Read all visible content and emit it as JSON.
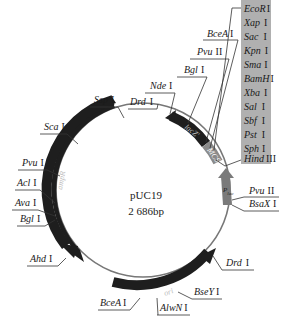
{
  "plasmid": {
    "name": "pUC19",
    "size": "2 686bp"
  },
  "features": [
    {
      "name": "lacZ'",
      "label": "lacZ'",
      "type": "gene",
      "color": "#1e1e1e"
    },
    {
      "name": "MCS",
      "label": "MCS",
      "type": "region",
      "color": "#8a8a8a"
    },
    {
      "name": "P_lac",
      "label": "P",
      "sub": "lac",
      "type": "promoter",
      "color": "#7a7a7a"
    },
    {
      "name": "ori",
      "label": "ori",
      "type": "origin",
      "color": "#1e1e1e"
    },
    {
      "name": "ampR",
      "label": "ampR",
      "type": "gene",
      "color": "#1e1e1e"
    }
  ],
  "mcs_box": {
    "background": "#b0b0b0",
    "sites": [
      {
        "name": "EcoR",
        "num": "I"
      },
      {
        "name": "Xap",
        "num": "I"
      },
      {
        "name": "Sac",
        "num": "I"
      },
      {
        "name": "Kpn",
        "num": "I"
      },
      {
        "name": "Sma",
        "num": "I"
      },
      {
        "name": "BamH",
        "num": "I"
      },
      {
        "name": "Xba",
        "num": "I"
      },
      {
        "name": "Sal",
        "num": "I"
      },
      {
        "name": "Sbf",
        "num": "I"
      },
      {
        "name": "Pst",
        "num": "I"
      },
      {
        "name": "Sph",
        "num": "I"
      },
      {
        "name": "Hind",
        "num": "III"
      }
    ]
  },
  "sites": {
    "bcea_top": {
      "name": "BceA",
      "num": "I"
    },
    "pvu2_top": {
      "name": "Pvu",
      "num": "II"
    },
    "bgl_top": {
      "name": "Bgl",
      "num": "I"
    },
    "nde": {
      "name": "Nde",
      "num": "I"
    },
    "drd_top": {
      "name": "Drd",
      "num": "I"
    },
    "ssp": {
      "name": "Ssp",
      "num": "I"
    },
    "sca": {
      "name": "Sca",
      "num": "I"
    },
    "pvu1": {
      "name": "Pvu",
      "num": "I"
    },
    "acl": {
      "name": "Acl",
      "num": "I"
    },
    "ava": {
      "name": "Ava",
      "num": "I"
    },
    "bgl_left": {
      "name": "Bgl",
      "num": "I"
    },
    "ahd": {
      "name": "Ahd",
      "num": "I"
    },
    "bcea_bottom": {
      "name": "BceA",
      "num": "I"
    },
    "alwn": {
      "name": "AlwN",
      "num": "I"
    },
    "bsey": {
      "name": "BseY",
      "num": "I"
    },
    "drd_right": {
      "name": "Drd",
      "num": "I"
    },
    "pvu2_right": {
      "name": "Pvu",
      "num": "II"
    },
    "bsax": {
      "name": "BsaX",
      "num": "I"
    }
  }
}
